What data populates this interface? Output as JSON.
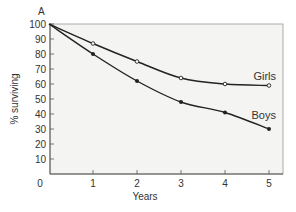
{
  "chart_data": {
    "type": "line",
    "panel_label": "A",
    "title": "",
    "xlabel": "Years",
    "ylabel": "% surviving",
    "xlim": [
      0,
      5
    ],
    "ylim": [
      0,
      100
    ],
    "x_ticks": [
      "0",
      "1",
      "2",
      "3",
      "4",
      "5"
    ],
    "y_ticks": [
      "10",
      "20",
      "30",
      "40",
      "50",
      "60",
      "70",
      "80",
      "90",
      "100"
    ],
    "grid": false,
    "legend": "inline labels at line ends",
    "x": [
      0,
      1,
      2,
      3,
      4,
      5
    ],
    "series": [
      {
        "name": "Girls",
        "marker": "open-circle",
        "values": [
          100,
          87,
          75,
          64,
          60,
          59
        ]
      },
      {
        "name": "Boys",
        "marker": "filled-circle",
        "values": [
          100,
          80,
          62,
          48,
          41,
          30
        ]
      }
    ]
  },
  "colors": {
    "plot_background": "#f4f4f2",
    "line": "#222222",
    "axis": "#555555",
    "frame": "#999999"
  }
}
